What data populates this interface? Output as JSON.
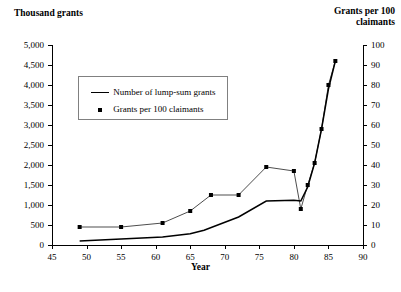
{
  "chart_data": {
    "type": "line",
    "title": "",
    "xlabel": "Year",
    "ylabel": "Thousand grants",
    "y2label": "Grants per 100 claimants",
    "xlim": [
      45,
      90
    ],
    "ylim": [
      0,
      5000
    ],
    "y2lim": [
      0,
      100
    ],
    "grid": false,
    "legend_position": "upper-left-inside",
    "xticks": [
      45,
      50,
      55,
      60,
      65,
      70,
      75,
      80,
      85,
      90
    ],
    "xticklabels": [
      "45",
      "50",
      "55",
      "60",
      "65",
      "70",
      "75",
      "80",
      "85",
      "90"
    ],
    "yticks": [
      0,
      500,
      1000,
      1500,
      2000,
      2500,
      3000,
      3500,
      4000,
      4500,
      5000
    ],
    "yticklabels": [
      "0",
      "500",
      "1,000",
      "1,500",
      "2,000",
      "2,500",
      "3,000",
      "3,500",
      "4,000",
      "4,500",
      "5,000"
    ],
    "y2ticks": [
      0,
      10,
      20,
      30,
      40,
      50,
      60,
      70,
      80,
      90,
      100
    ],
    "y2ticklabels": [
      "0",
      "10",
      "20",
      "30",
      "40",
      "50",
      "60",
      "70",
      "80",
      "90",
      "100"
    ],
    "series": [
      {
        "name": "Number of lump-sum grants",
        "axis": "left",
        "style": "solid-line",
        "marker": "none",
        "color": "#000000",
        "x": [
          49,
          55,
          61,
          65,
          67,
          72,
          76,
          80,
          81,
          82,
          83,
          84,
          85,
          86
        ],
        "values": [
          100,
          150,
          200,
          280,
          370,
          700,
          1100,
          1120,
          1100,
          1450,
          2050,
          2900,
          3900,
          4600
        ]
      },
      {
        "name": "Grants per 100 claimants",
        "axis": "right",
        "style": "thin-line-with-markers",
        "marker": "square",
        "color": "#000000",
        "x": [
          49,
          55,
          61,
          65,
          68,
          72,
          76,
          80,
          81,
          82,
          83,
          84,
          85,
          86
        ],
        "values": [
          9,
          9,
          11,
          17,
          25,
          25,
          39,
          37,
          18,
          30,
          41,
          58,
          80,
          92
        ]
      }
    ]
  },
  "axis_titles": {
    "left": "Thousand grants",
    "right": "Grants per 100 claimants",
    "right_line1": "Grants per 100",
    "right_line2": "claimants",
    "bottom": "Year"
  },
  "legend": {
    "items": [
      {
        "label": "Number of lump-sum grants",
        "key": "line-key"
      },
      {
        "label": "Grants per 100 claimants",
        "key": "square-marker-key"
      }
    ]
  }
}
